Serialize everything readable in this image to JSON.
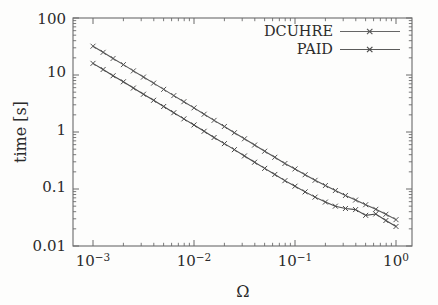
{
  "chart_data": {
    "type": "line",
    "title": "",
    "subtitle": "",
    "xlabel": "Ω",
    "ylabel": "time [s]",
    "xscale": "log",
    "yscale": "log",
    "xlim": [
      0.001,
      1.0
    ],
    "ylim": [
      0.01,
      100
    ],
    "grid": false,
    "legend_position": "top-right-inside",
    "x_tick_labels": [
      "10−3",
      "10−2",
      "10−1",
      "10⁰"
    ],
    "x_tick_values": [
      0.001,
      0.01,
      0.1,
      1.0
    ],
    "y_tick_labels": [
      "100",
      "10",
      "1",
      "0.1",
      "0.01"
    ],
    "y_tick_values": [
      100,
      10,
      1,
      0.1,
      0.01
    ],
    "minor_ticks": true,
    "marker": "x",
    "series": [
      {
        "name": "DCUHRE",
        "color": "#555555",
        "x": [
          0.001,
          0.00126,
          0.00158,
          0.002,
          0.00251,
          0.00316,
          0.00398,
          0.00501,
          0.00631,
          0.00794,
          0.01,
          0.0126,
          0.0158,
          0.02,
          0.0251,
          0.0316,
          0.0398,
          0.0501,
          0.0631,
          0.0794,
          0.1,
          0.126,
          0.158,
          0.2,
          0.251,
          0.316,
          0.398,
          0.501,
          0.631,
          0.794,
          1.0
        ],
        "y": [
          32.0,
          25.0,
          19.5,
          15.2,
          11.8,
          9.2,
          7.2,
          5.6,
          4.35,
          3.4,
          2.65,
          2.05,
          1.6,
          1.25,
          0.97,
          0.76,
          0.59,
          0.46,
          0.36,
          0.28,
          0.225,
          0.178,
          0.142,
          0.115,
          0.094,
          0.077,
          0.064,
          0.053,
          0.044,
          0.036,
          0.029
        ]
      },
      {
        "name": "PAID",
        "color": "#4a4a4a",
        "x": [
          0.001,
          0.00126,
          0.00158,
          0.002,
          0.00251,
          0.00316,
          0.00398,
          0.00501,
          0.00631,
          0.00794,
          0.01,
          0.0126,
          0.0158,
          0.02,
          0.0251,
          0.0316,
          0.0398,
          0.0501,
          0.0631,
          0.0794,
          0.1,
          0.126,
          0.158,
          0.2,
          0.251,
          0.316,
          0.398,
          0.501,
          0.631,
          0.794,
          1.0
        ],
        "y": [
          16.0,
          12.5,
          9.7,
          7.6,
          5.9,
          4.6,
          3.6,
          2.8,
          2.18,
          1.7,
          1.33,
          1.03,
          0.8,
          0.625,
          0.49,
          0.38,
          0.295,
          0.23,
          0.18,
          0.14,
          0.112,
          0.089,
          0.072,
          0.059,
          0.05,
          0.0455,
          0.0435,
          0.0345,
          0.0365,
          0.028,
          0.022
        ]
      }
    ]
  },
  "legend": {
    "entries": [
      {
        "label": "DCUHRE"
      },
      {
        "label": "PAID"
      }
    ]
  },
  "axes": {
    "x_title": "Ω",
    "y_title": "time [s]"
  }
}
